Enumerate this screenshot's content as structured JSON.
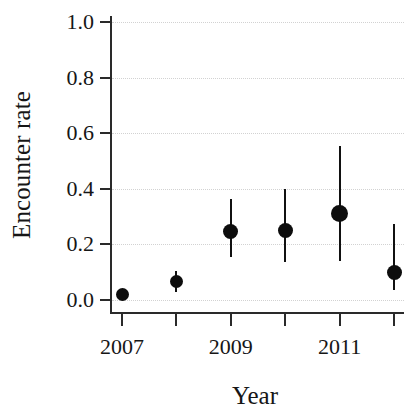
{
  "chart_data": {
    "type": "scatter",
    "title": "",
    "subtitle": "",
    "xlabel": "Year",
    "ylabel": "Encounter rate",
    "x": [
      2007,
      2008,
      2009,
      2010,
      2011,
      2012
    ],
    "categories": [
      "2007",
      "2008",
      "2009",
      "2010",
      "2011",
      "2012"
    ],
    "values": [
      0.02,
      0.065,
      0.245,
      0.25,
      0.31,
      0.1
    ],
    "error_low": [
      0.0,
      0.03,
      0.155,
      0.135,
      0.14,
      0.035
    ],
    "error_high": [
      0.04,
      0.105,
      0.365,
      0.4,
      0.555,
      0.275
    ],
    "series": [
      {
        "name": "Encounter rate",
        "values": [
          0.02,
          0.065,
          0.245,
          0.25,
          0.31,
          0.1
        ],
        "error_low": [
          0.0,
          0.03,
          0.155,
          0.135,
          0.14,
          0.035
        ],
        "error_high": [
          0.04,
          0.105,
          0.365,
          0.4,
          0.555,
          0.275
        ],
        "marker": "filled-circle",
        "color": "#0d0d0d"
      }
    ],
    "points": [
      {
        "x": 2007,
        "y": 0.02,
        "low": 0.0,
        "high": 0.04
      },
      {
        "x": 2008,
        "y": 0.065,
        "low": 0.03,
        "high": 0.105
      },
      {
        "x": 2009,
        "y": 0.245,
        "low": 0.155,
        "high": 0.365
      },
      {
        "x": 2010,
        "y": 0.25,
        "low": 0.135,
        "high": 0.4
      },
      {
        "x": 2011,
        "y": 0.31,
        "low": 0.14,
        "high": 0.555
      },
      {
        "x": 2012,
        "y": 0.1,
        "low": 0.035,
        "high": 0.275
      }
    ],
    "ylim": [
      0.0,
      1.0
    ],
    "xlim": [
      2006.5,
      2012.5
    ],
    "yticks": [
      0.0,
      0.2,
      0.4,
      0.6,
      0.8,
      1.0
    ],
    "ytick_labels": [
      "0.0",
      "0.2",
      "0.4",
      "0.6",
      "0.8",
      "1.0"
    ],
    "xticks": [
      2007,
      2008,
      2009,
      2010,
      2011,
      2012
    ],
    "xtick_labels": [
      "2007",
      "",
      "2009",
      "",
      "2011",
      ""
    ],
    "grid": true,
    "grid_axis": "y",
    "grid_style": "dotted",
    "grid_color": "#d2d2d2",
    "legend": false,
    "legend_position": "none",
    "axis_color": "#2a2a2a",
    "marker_color": "#0d0d0d",
    "background": "#ffffff"
  }
}
